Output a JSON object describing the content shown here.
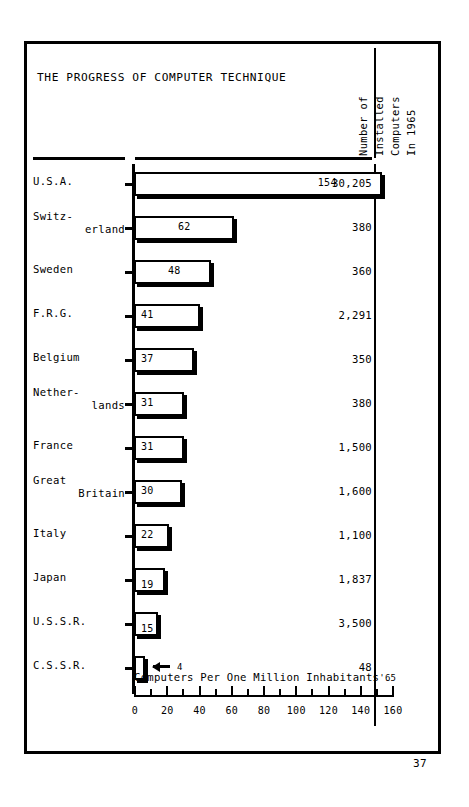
{
  "chart_title": "THE PROGRESS OF COMPUTER TECHNIQUE",
  "right_column_header": {
    "line1": "Number of",
    "line2": "Installed",
    "line3": "Computers",
    "line4": "In 1965"
  },
  "axis_caption": {
    "text": "Computers Per One Million Inhabitants",
    "suffix": "'65"
  },
  "page_number": "37",
  "chart_data": {
    "type": "bar",
    "orientation": "horizontal",
    "title": "THE PROGRESS OF COMPUTER TECHNIQUE",
    "xlabel": "Computers Per One Million Inhabitants'65",
    "ylabel": "",
    "xlim": [
      0,
      160
    ],
    "grid": false,
    "legend": null,
    "major_ticks": [
      0,
      20,
      40,
      60,
      80,
      100,
      120,
      140,
      160
    ],
    "minor_ticks": [
      10,
      30,
      50,
      70,
      90,
      110,
      130,
      150
    ],
    "tick_labels": [
      "0",
      "20",
      "40",
      "60",
      "80",
      "100",
      "120",
      "140",
      "160"
    ],
    "categories": [
      "U.S.A.",
      "Switz-erland",
      "Sweden",
      "F.R.G.",
      "Belgium",
      "Nether-lands",
      "France",
      "Great Britain",
      "Italy",
      "Japan",
      "U.S.S.R.",
      "C.S.S.R."
    ],
    "values": [
      154,
      62,
      48,
      41,
      37,
      31,
      31,
      30,
      22,
      19,
      15,
      4
    ],
    "secondary_column": {
      "name": "Number of Installed Computers In 1965",
      "values": [
        "30,205",
        "380",
        "360",
        "2,291",
        "350",
        "380",
        "1,500",
        "1,600",
        "1,100",
        "1,837",
        "3,500",
        "48"
      ]
    }
  },
  "rows": [
    {
      "label_line1": "U.S.A.",
      "label_line2": "",
      "two_line": false,
      "value": "154",
      "value_num": 154,
      "installed": "30,205",
      "arrow": false
    },
    {
      "label_line1": "Switz-",
      "label_line2": "erland",
      "two_line": true,
      "value": "62",
      "value_num": 62,
      "installed": "380",
      "arrow": false
    },
    {
      "label_line1": "Sweden",
      "label_line2": "",
      "two_line": false,
      "value": "48",
      "value_num": 48,
      "installed": "360",
      "arrow": false
    },
    {
      "label_line1": "F.R.G.",
      "label_line2": "",
      "two_line": false,
      "value": "41",
      "value_num": 41,
      "installed": "2,291",
      "arrow": false
    },
    {
      "label_line1": "Belgium",
      "label_line2": "",
      "two_line": false,
      "value": "37",
      "value_num": 37,
      "installed": "350",
      "arrow": false
    },
    {
      "label_line1": "Nether-",
      "label_line2": "lands",
      "two_line": true,
      "value": "31",
      "value_num": 31,
      "installed": "380",
      "arrow": false
    },
    {
      "label_line1": "France",
      "label_line2": "",
      "two_line": false,
      "value": "31",
      "value_num": 31,
      "installed": "1,500",
      "arrow": false
    },
    {
      "label_line1": "Great",
      "label_line2": "Britain",
      "two_line": true,
      "value": "30",
      "value_num": 30,
      "installed": "1,600",
      "arrow": false
    },
    {
      "label_line1": "Italy",
      "label_line2": "",
      "two_line": false,
      "value": "22",
      "value_num": 22,
      "installed": "1,100",
      "arrow": false
    },
    {
      "label_line1": "Japan",
      "label_line2": "",
      "two_line": false,
      "value": "19",
      "value_num": 19,
      "installed": "1,837",
      "arrow": false
    },
    {
      "label_line1": "U.S.S.R.",
      "label_line2": "",
      "two_line": false,
      "value": "15",
      "value_num": 15,
      "installed": "3,500",
      "arrow": false
    },
    {
      "label_line1": "C.S.S.R.",
      "label_line2": "",
      "two_line": false,
      "value": "4",
      "value_num": 4,
      "installed": "48",
      "arrow": true
    }
  ]
}
